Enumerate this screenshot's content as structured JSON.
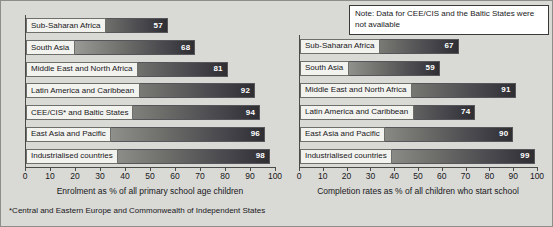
{
  "figure": {
    "background_color": "#d9d9d6",
    "footnote": "*Central and Eastern Europe and Commonwealth of Independent States",
    "note": "Note: Data for CEE/CIS and the Baltic States were not available"
  },
  "chart_data": [
    {
      "type": "bar",
      "orientation": "horizontal",
      "panel": "left",
      "title": "",
      "xlabel": "Enrolment as % of all primary school age children",
      "ylabel": "",
      "xlim": [
        0,
        100
      ],
      "xticks": [
        0,
        10,
        20,
        30,
        40,
        50,
        60,
        70,
        80,
        90,
        100
      ],
      "grid": false,
      "legend": "none",
      "categories": [
        "Sub-Saharan Africa",
        "South Asia",
        "Middle East and North Africa",
        "Latin America and Caribbean",
        "CEE/CIS* and Baltic States",
        "East Asia and Pacific",
        "Industrialised countries"
      ],
      "values": [
        57,
        68,
        81,
        92,
        94,
        96,
        98
      ]
    },
    {
      "type": "bar",
      "orientation": "horizontal",
      "panel": "right",
      "title": "",
      "xlabel": "Completion rates as % of all children who start school",
      "ylabel": "",
      "xlim": [
        0,
        100
      ],
      "xticks": [
        0,
        10,
        20,
        30,
        40,
        50,
        60,
        70,
        80,
        90,
        100
      ],
      "grid": false,
      "legend": "none",
      "categories": [
        "Sub-Saharan Africa",
        "South Asia",
        "Middle East and North Africa",
        "Latin America and Caribbean",
        "East Asia and Pacific",
        "Industrialised countries"
      ],
      "values": [
        67,
        59,
        91,
        74,
        90,
        99
      ]
    }
  ]
}
